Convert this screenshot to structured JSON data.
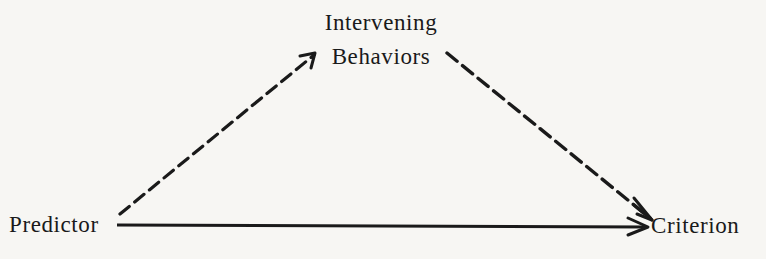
{
  "diagram": {
    "type": "path diagram",
    "nodes": {
      "predictor": {
        "label": "Predictor"
      },
      "criterion": {
        "label": "Criterion"
      },
      "intervening": {
        "line1": "Intervening",
        "line2": "Behaviors"
      }
    },
    "edges": [
      {
        "from": "Predictor",
        "to": "Intervening Behaviors",
        "style": "dashed",
        "arrow": true
      },
      {
        "from": "Intervening Behaviors",
        "to": "Criterion",
        "style": "dashed",
        "arrow": true
      },
      {
        "from": "Predictor",
        "to": "Criterion",
        "style": "solid",
        "arrow": true
      }
    ],
    "colors": {
      "ink": "#1a1a1a",
      "paper": "#f7f6f3"
    }
  }
}
